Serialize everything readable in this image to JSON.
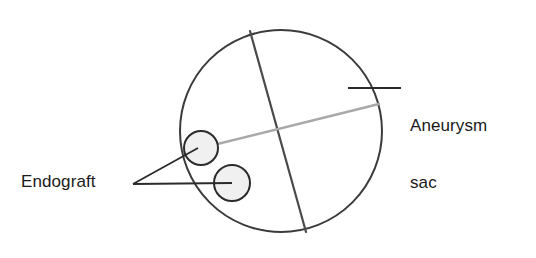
{
  "figure": {
    "type": "medical-illustration",
    "background_color": "#ffffff",
    "width": 536,
    "height": 258
  },
  "labels": {
    "aneurysm": {
      "line1": "Aneurysm",
      "line2": "sac",
      "full_text": "Aneurysm sac",
      "color": "#1a1a1a",
      "leader_line_color": "#2b2b2b"
    },
    "endograft": {
      "text": "Endograft",
      "color": "#1a1a1a",
      "leader_line_color": "#2b2b2b"
    }
  },
  "shapes": {
    "aneurysm_sac": {
      "name": "aneurysm-sac-outline",
      "shape": "circle",
      "cx": 281,
      "cy": 131,
      "r": 101,
      "stroke": "#3b3b3b",
      "fill": "none",
      "stroke_width": 2
    },
    "dark_chord": {
      "name": "dark-chord-line",
      "shape": "line",
      "x1": 250,
      "y1": 31,
      "x2": 306,
      "y2": 232,
      "stroke": "#4a4a4a",
      "stroke_width": 2.2
    },
    "gray_chord": {
      "name": "gray-chord-line",
      "shape": "line",
      "x1": 189,
      "y1": 151,
      "x2": 379,
      "y2": 104,
      "stroke": "#a8a8a8",
      "stroke_width": 2.4
    },
    "endograft_limb_upper": {
      "name": "endograft-limb-upper",
      "shape": "circle",
      "cx": 201,
      "cy": 148,
      "r": 17,
      "stroke": "#2b2b2b",
      "fill": "#f0f0f0",
      "stroke_width": 2
    },
    "endograft_limb_lower": {
      "name": "endograft-limb-lower",
      "shape": "circle",
      "cx": 232,
      "cy": 183,
      "r": 18,
      "stroke": "#2b2b2b",
      "fill": "#f0f0f0",
      "stroke_width": 2
    }
  },
  "leaders": {
    "aneurysm_leader": {
      "x1": 348,
      "y1": 88,
      "x2": 401,
      "y2": 88,
      "stroke": "#2b2b2b",
      "stroke_width": 1.8
    },
    "endograft_leader_upper": {
      "x1": 133,
      "y1": 184,
      "x2": 198,
      "y2": 148,
      "stroke": "#2b2b2b",
      "stroke_width": 1.8
    },
    "endograft_leader_lower": {
      "x1": 133,
      "y1": 184,
      "x2": 232,
      "y2": 183,
      "stroke": "#2b2b2b",
      "stroke_width": 1.8
    }
  }
}
